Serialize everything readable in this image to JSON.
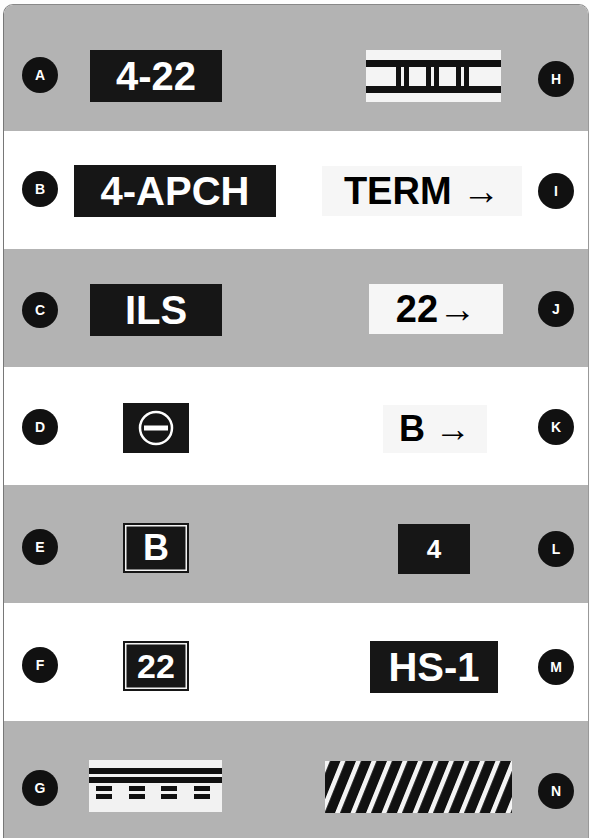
{
  "colors": {
    "gray_band": "#b3b3b3",
    "white_band": "#ffffff",
    "sign_dark": "#161616",
    "sign_light": "#f6f6f6",
    "badge": "#111111"
  },
  "rows": [
    {
      "band": "gray",
      "left": {
        "letter": "A",
        "text": "4-22",
        "style": "dark"
      },
      "right": {
        "letter": "H",
        "text": "",
        "style": "ils-critical-boundary",
        "icon": "ladder-marking-icon"
      }
    },
    {
      "band": "white",
      "left": {
        "letter": "B",
        "text": "4-APCH",
        "style": "dark"
      },
      "right": {
        "letter": "I",
        "text": "TERM →",
        "style": "light"
      }
    },
    {
      "band": "gray",
      "left": {
        "letter": "C",
        "text": "ILS",
        "style": "dark"
      },
      "right": {
        "letter": "J",
        "text": "22→",
        "style": "light"
      }
    },
    {
      "band": "white",
      "left": {
        "letter": "D",
        "text": "",
        "style": "dark",
        "icon": "no-entry-icon"
      },
      "right": {
        "letter": "K",
        "text": "B →",
        "style": "light"
      }
    },
    {
      "band": "gray",
      "left": {
        "letter": "E",
        "text": "B",
        "style": "dark-bordered"
      },
      "right": {
        "letter": "L",
        "text": "4",
        "style": "dark"
      }
    },
    {
      "band": "white",
      "left": {
        "letter": "F",
        "text": "22",
        "style": "dark-bordered"
      },
      "right": {
        "letter": "M",
        "text": "HS-1",
        "style": "dark"
      }
    },
    {
      "band": "gray",
      "left": {
        "letter": "G",
        "text": "",
        "style": "hold-position-marking",
        "icon": "hold-line-marking-icon"
      },
      "right": {
        "letter": "N",
        "text": "",
        "style": "hatched",
        "icon": "diagonal-stripes-icon"
      }
    }
  ]
}
